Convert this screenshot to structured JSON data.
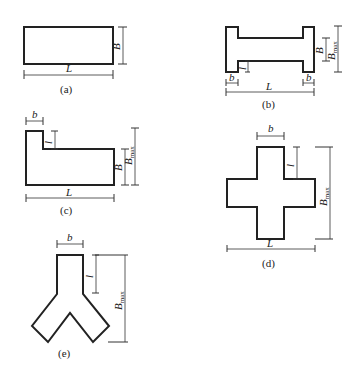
{
  "figure": {
    "panels": [
      {
        "id": "a",
        "caption": "(a)",
        "shape": "rectangle",
        "dims": {
          "length": "L",
          "width": "B"
        }
      },
      {
        "id": "b",
        "caption": "(b)",
        "shape": "I-shape",
        "dims": {
          "length": "L",
          "width": "B",
          "max_width": "B",
          "max_width_sub": "max",
          "flange": "b",
          "stub": "l"
        }
      },
      {
        "id": "c",
        "caption": "(c)",
        "shape": "L-shape",
        "dims": {
          "length": "L",
          "width": "B",
          "max_width": "B",
          "max_width_sub": "max",
          "flange": "b",
          "stub": "l"
        }
      },
      {
        "id": "d",
        "caption": "(d)",
        "shape": "cross",
        "dims": {
          "length": "L",
          "max_width": "B",
          "max_width_sub": "max",
          "arm": "b",
          "stub": "l"
        }
      },
      {
        "id": "e",
        "caption": "(e)",
        "shape": "Y-shape",
        "dims": {
          "max_width": "B",
          "max_width_sub": "max",
          "arm": "b",
          "stub": "l"
        }
      }
    ]
  }
}
